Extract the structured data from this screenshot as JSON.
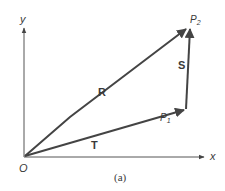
{
  "figure": {
    "caption": "(a)",
    "colors": {
      "line": "#444444",
      "text": "#3a3a3a",
      "background": "#ffffff"
    },
    "axes": {
      "x_label": "x",
      "y_label": "y",
      "origin_label": "O"
    },
    "points": {
      "p1": {
        "base": "P",
        "sub": "1"
      },
      "p2": {
        "base": "P",
        "sub": "2"
      }
    },
    "vectors": [
      {
        "name": "R",
        "from": "O",
        "to": "P2"
      },
      {
        "name": "T",
        "from": "O",
        "to": "P1"
      },
      {
        "name": "S",
        "from": "P1",
        "to": "P2"
      }
    ]
  }
}
